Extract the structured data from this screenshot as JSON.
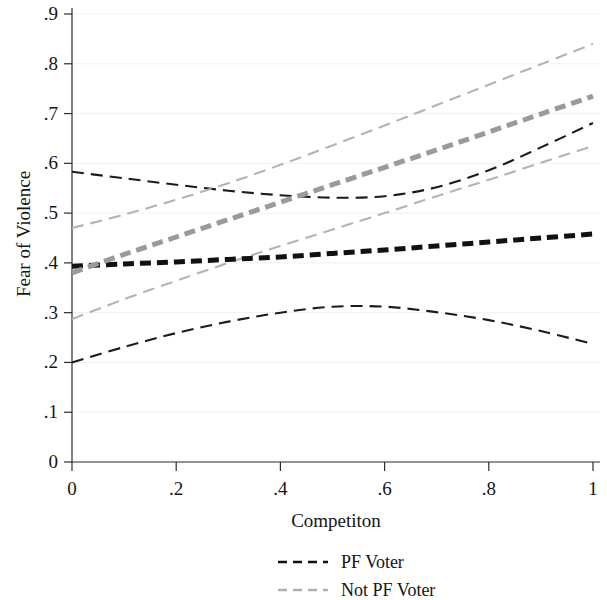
{
  "chart_data": {
    "type": "line",
    "title": "",
    "xlabel": "Competiton",
    "ylabel": "Fear of Violence",
    "xlim": [
      0,
      1
    ],
    "ylim": [
      0,
      0.9
    ],
    "grid": true,
    "grid_style": "faint horizontal gridlines at y tick values",
    "legend_position": "below-axis-centered",
    "x_ticks": [
      "0",
      ".2",
      ".4",
      ".6",
      ".8",
      "1"
    ],
    "x_tick_values": [
      0,
      0.2,
      0.4,
      0.6,
      0.8,
      1
    ],
    "y_ticks": [
      "0",
      ".1",
      ".2",
      ".3",
      ".4",
      ".5",
      ".6",
      ".7",
      ".8",
      ".9"
    ],
    "y_tick_values": [
      0,
      0.1,
      0.2,
      0.3,
      0.4,
      0.5,
      0.6,
      0.7,
      0.8,
      0.9
    ],
    "x": [
      0,
      0.1,
      0.2,
      0.3,
      0.4,
      0.5,
      0.6,
      0.7,
      0.8,
      0.9,
      1
    ],
    "series": [
      {
        "name": "PF Voter",
        "role": "fit",
        "color": "#111111",
        "style": "thick-dashed",
        "values": [
          0.393,
          0.398,
          0.402,
          0.407,
          0.412,
          0.419,
          0.426,
          0.434,
          0.442,
          0.45,
          0.458
        ]
      },
      {
        "name": "PF Voter upper CI",
        "role": "confidence-upper",
        "color": "#1b1b1b",
        "style": "thin-dashed",
        "values": [
          0.583,
          0.57,
          0.557,
          0.545,
          0.536,
          0.531,
          0.534,
          0.552,
          0.586,
          0.632,
          0.681
        ]
      },
      {
        "name": "PF Voter lower CI",
        "role": "confidence-lower",
        "color": "#1b1b1b",
        "style": "thin-dashed",
        "values": [
          0.2,
          0.231,
          0.259,
          0.282,
          0.3,
          0.312,
          0.312,
          0.301,
          0.285,
          0.263,
          0.237
        ]
      },
      {
        "name": "Not PF Voter",
        "role": "fit",
        "color": "#9a9a9a",
        "style": "thick-dashed",
        "values": [
          0.38,
          0.417,
          0.452,
          0.487,
          0.522,
          0.557,
          0.592,
          0.627,
          0.663,
          0.699,
          0.735
        ]
      },
      {
        "name": "Not PF Voter upper CI",
        "role": "confidence-upper",
        "color": "#b3b3b3",
        "style": "thin-dashed",
        "values": [
          0.47,
          0.497,
          0.527,
          0.56,
          0.597,
          0.636,
          0.676,
          0.717,
          0.758,
          0.799,
          0.84
        ]
      },
      {
        "name": "Not PF Voter lower CI",
        "role": "confidence-lower",
        "color": "#b3b3b3",
        "style": "thin-dashed",
        "values": [
          0.287,
          0.327,
          0.364,
          0.4,
          0.434,
          0.467,
          0.5,
          0.534,
          0.567,
          0.601,
          0.635
        ]
      }
    ],
    "legend": [
      {
        "label": "PF Voter",
        "color": "#111111",
        "style": "dashed"
      },
      {
        "label": "Not PF Voter",
        "color": "#b0b0b0",
        "style": "dashed"
      }
    ]
  },
  "axes": {
    "y_title": "Fear of Violence",
    "x_title": "Competiton"
  }
}
